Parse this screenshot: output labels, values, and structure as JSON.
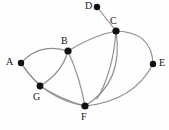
{
  "figure": {
    "kind": "undirected-graph-drawing",
    "width": 169,
    "height": 130,
    "background_color": "#fefefe",
    "edge_color": "#8d8d8d",
    "node_color": "#111111",
    "label_color": "#141414"
  },
  "graph_data": {
    "type": "graph",
    "title": "",
    "directed": false,
    "node_labels": [
      "A",
      "B",
      "C",
      "D",
      "E",
      "F",
      "G"
    ],
    "nodes": [
      {
        "id": "A",
        "label": "A",
        "x": 21,
        "y": 63,
        "r": 3.2,
        "label_x": 6,
        "label_y": 57
      },
      {
        "id": "B",
        "label": "B",
        "x": 68,
        "y": 51,
        "r": 3.6,
        "label_x": 61,
        "label_y": 36
      },
      {
        "id": "C",
        "label": "C",
        "x": 116,
        "y": 31,
        "r": 3.6,
        "label_x": 110,
        "label_y": 16
      },
      {
        "id": "D",
        "label": "D",
        "x": 97,
        "y": 7,
        "r": 3.2,
        "label_x": 85,
        "label_y": 1
      },
      {
        "id": "E",
        "label": "E",
        "x": 153,
        "y": 64,
        "r": 3.2,
        "label_x": 159,
        "label_y": 58
      },
      {
        "id": "F",
        "label": "F",
        "x": 85,
        "y": 106,
        "r": 3.6,
        "label_x": 81,
        "label_y": 112
      },
      {
        "id": "G",
        "label": "G",
        "x": 40,
        "y": 86,
        "r": 3.4,
        "label_x": 33,
        "label_y": 92
      }
    ],
    "edges": [
      {
        "source": "A",
        "target": "B",
        "curve": "arc-up",
        "path": "M 21 63 Q 40 42 68 51"
      },
      {
        "source": "A",
        "target": "G",
        "curve": "slight",
        "path": "M 21 63 Q 29 75 40 86"
      },
      {
        "source": "G",
        "target": "B",
        "curve": "arc-right",
        "path": "M 40 86 Q 62 73 68 51"
      },
      {
        "source": "G",
        "target": "F",
        "curve": "arc-down",
        "path": "M 40 86 Q 62 100 85 106"
      },
      {
        "source": "B",
        "target": "F",
        "curve": "arc-right",
        "path": "M 68 51 Q 80 78 85 106"
      },
      {
        "source": "B",
        "target": "C",
        "curve": "arc-up",
        "path": "M 68 51 Q 92 36 116 31"
      },
      {
        "source": "C",
        "target": "D",
        "curve": "straight",
        "path": "M 116 31 L 97 7"
      },
      {
        "source": "C",
        "target": "F",
        "curve": "near-straight",
        "path": "M 116 31 Q 113 72 97 99"
      },
      {
        "source": "C",
        "target": "F",
        "curve": "arc-wide",
        "path": "M 116 31 Q 124 82 85 106"
      },
      {
        "source": "C",
        "target": "E",
        "curve": "arc-right",
        "path": "M 116 31 Q 152 32 153 64"
      },
      {
        "source": "E",
        "target": "F",
        "curve": "arc-down",
        "path": "M 153 64 Q 134 101 85 106"
      },
      {
        "source": "A",
        "target": "F",
        "curve": "arc-down-long",
        "path": "M 21 63 Q 44 99 85 106"
      }
    ],
    "edge_count": 12,
    "node_count": 7
  }
}
